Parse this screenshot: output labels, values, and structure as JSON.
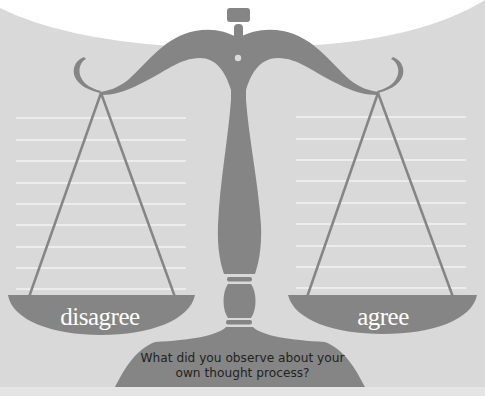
{
  "diagram": {
    "type": "balance-scale-worksheet",
    "left_pan": {
      "label": "disagree",
      "line_count": 9
    },
    "right_pan": {
      "label": "agree",
      "line_count": 9
    },
    "base_prompt": "What did you observe about your own thought process?",
    "top_text_cut_off": ""
  },
  "colors": {
    "background": "#d9d9d9",
    "top_arc": "#ffffff",
    "scale": "#858585",
    "writing_lines": "#f2f2f2",
    "pan_label_text": "#ffffff",
    "prompt_text": "#222222"
  }
}
